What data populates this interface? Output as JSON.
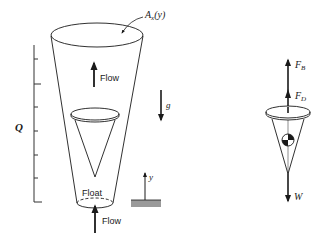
{
  "diagram": {
    "type": "rotameter-flowmeter",
    "colors": {
      "stroke": "#1a1a1a",
      "ground_fill": "#9a9a9a",
      "background": "#ffffff"
    },
    "left_figure": {
      "area_label": "A",
      "area_subscript": "x",
      "area_arg": "(y)",
      "flow_top_label": "Flow",
      "flow_bottom_label": "Flow",
      "float_label": "Float",
      "gravity_label": "g",
      "scale_label": "Q",
      "axis_label": "y",
      "scale_ticks": 7
    },
    "right_figure": {
      "buoyancy_label": "F",
      "buoyancy_sub": "B",
      "drag_label": "F",
      "drag_sub": "D",
      "weight_label": "W",
      "center_of_gravity_symbol": "cg-marker"
    }
  }
}
